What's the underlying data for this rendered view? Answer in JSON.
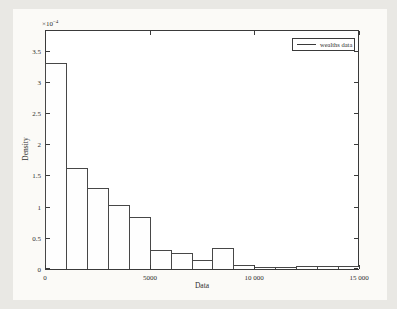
{
  "style": {
    "page_bg": "#e9e8e4",
    "figure_bg": "#fbfaf7",
    "plot_bg": "#ffffff",
    "axis_color": "#3a3a3a",
    "text_color": "#2f2f2f",
    "bar_fill": "#fefefe",
    "bar_edge": "#474747"
  },
  "chart_data": {
    "type": "bar",
    "subtype": "histogram",
    "title": "",
    "xlabel": "Data",
    "ylabel": "Density",
    "y_multiplier": {
      "base": "×10",
      "exp": "−4"
    },
    "value_scale": "1e-4",
    "legend": {
      "label": "wealths data",
      "position": "top-right-inside"
    },
    "grid": false,
    "bin_edges": [
      0,
      1000,
      2000,
      3000,
      4000,
      5000,
      6000,
      7000,
      8000,
      9000,
      10000,
      11000,
      12000,
      13000,
      14000,
      15000
    ],
    "densities_x1e-4": [
      3.3,
      1.62,
      1.3,
      1.02,
      0.84,
      0.3,
      0.25,
      0.15,
      0.33,
      0.06,
      0.02,
      0.02,
      0.05,
      0.05,
      0.05
    ],
    "xlim": [
      0,
      15000
    ],
    "ylim_display": [
      0,
      3.85
    ],
    "x_ticks": [
      {
        "value": 0,
        "label": "0"
      },
      {
        "value": 5000,
        "label": "5000"
      },
      {
        "value": 10000,
        "label": "10 000"
      },
      {
        "value": 15000,
        "label": "15 000"
      }
    ],
    "y_ticks": [
      {
        "value": 0,
        "label": "0"
      },
      {
        "value": 0.5,
        "label": "0.5"
      },
      {
        "value": 1,
        "label": "1"
      },
      {
        "value": 1.5,
        "label": "1.5"
      },
      {
        "value": 2,
        "label": "2"
      },
      {
        "value": 2.5,
        "label": "2.5"
      },
      {
        "value": 3,
        "label": "3"
      },
      {
        "value": 3.5,
        "label": "3.5"
      }
    ]
  }
}
